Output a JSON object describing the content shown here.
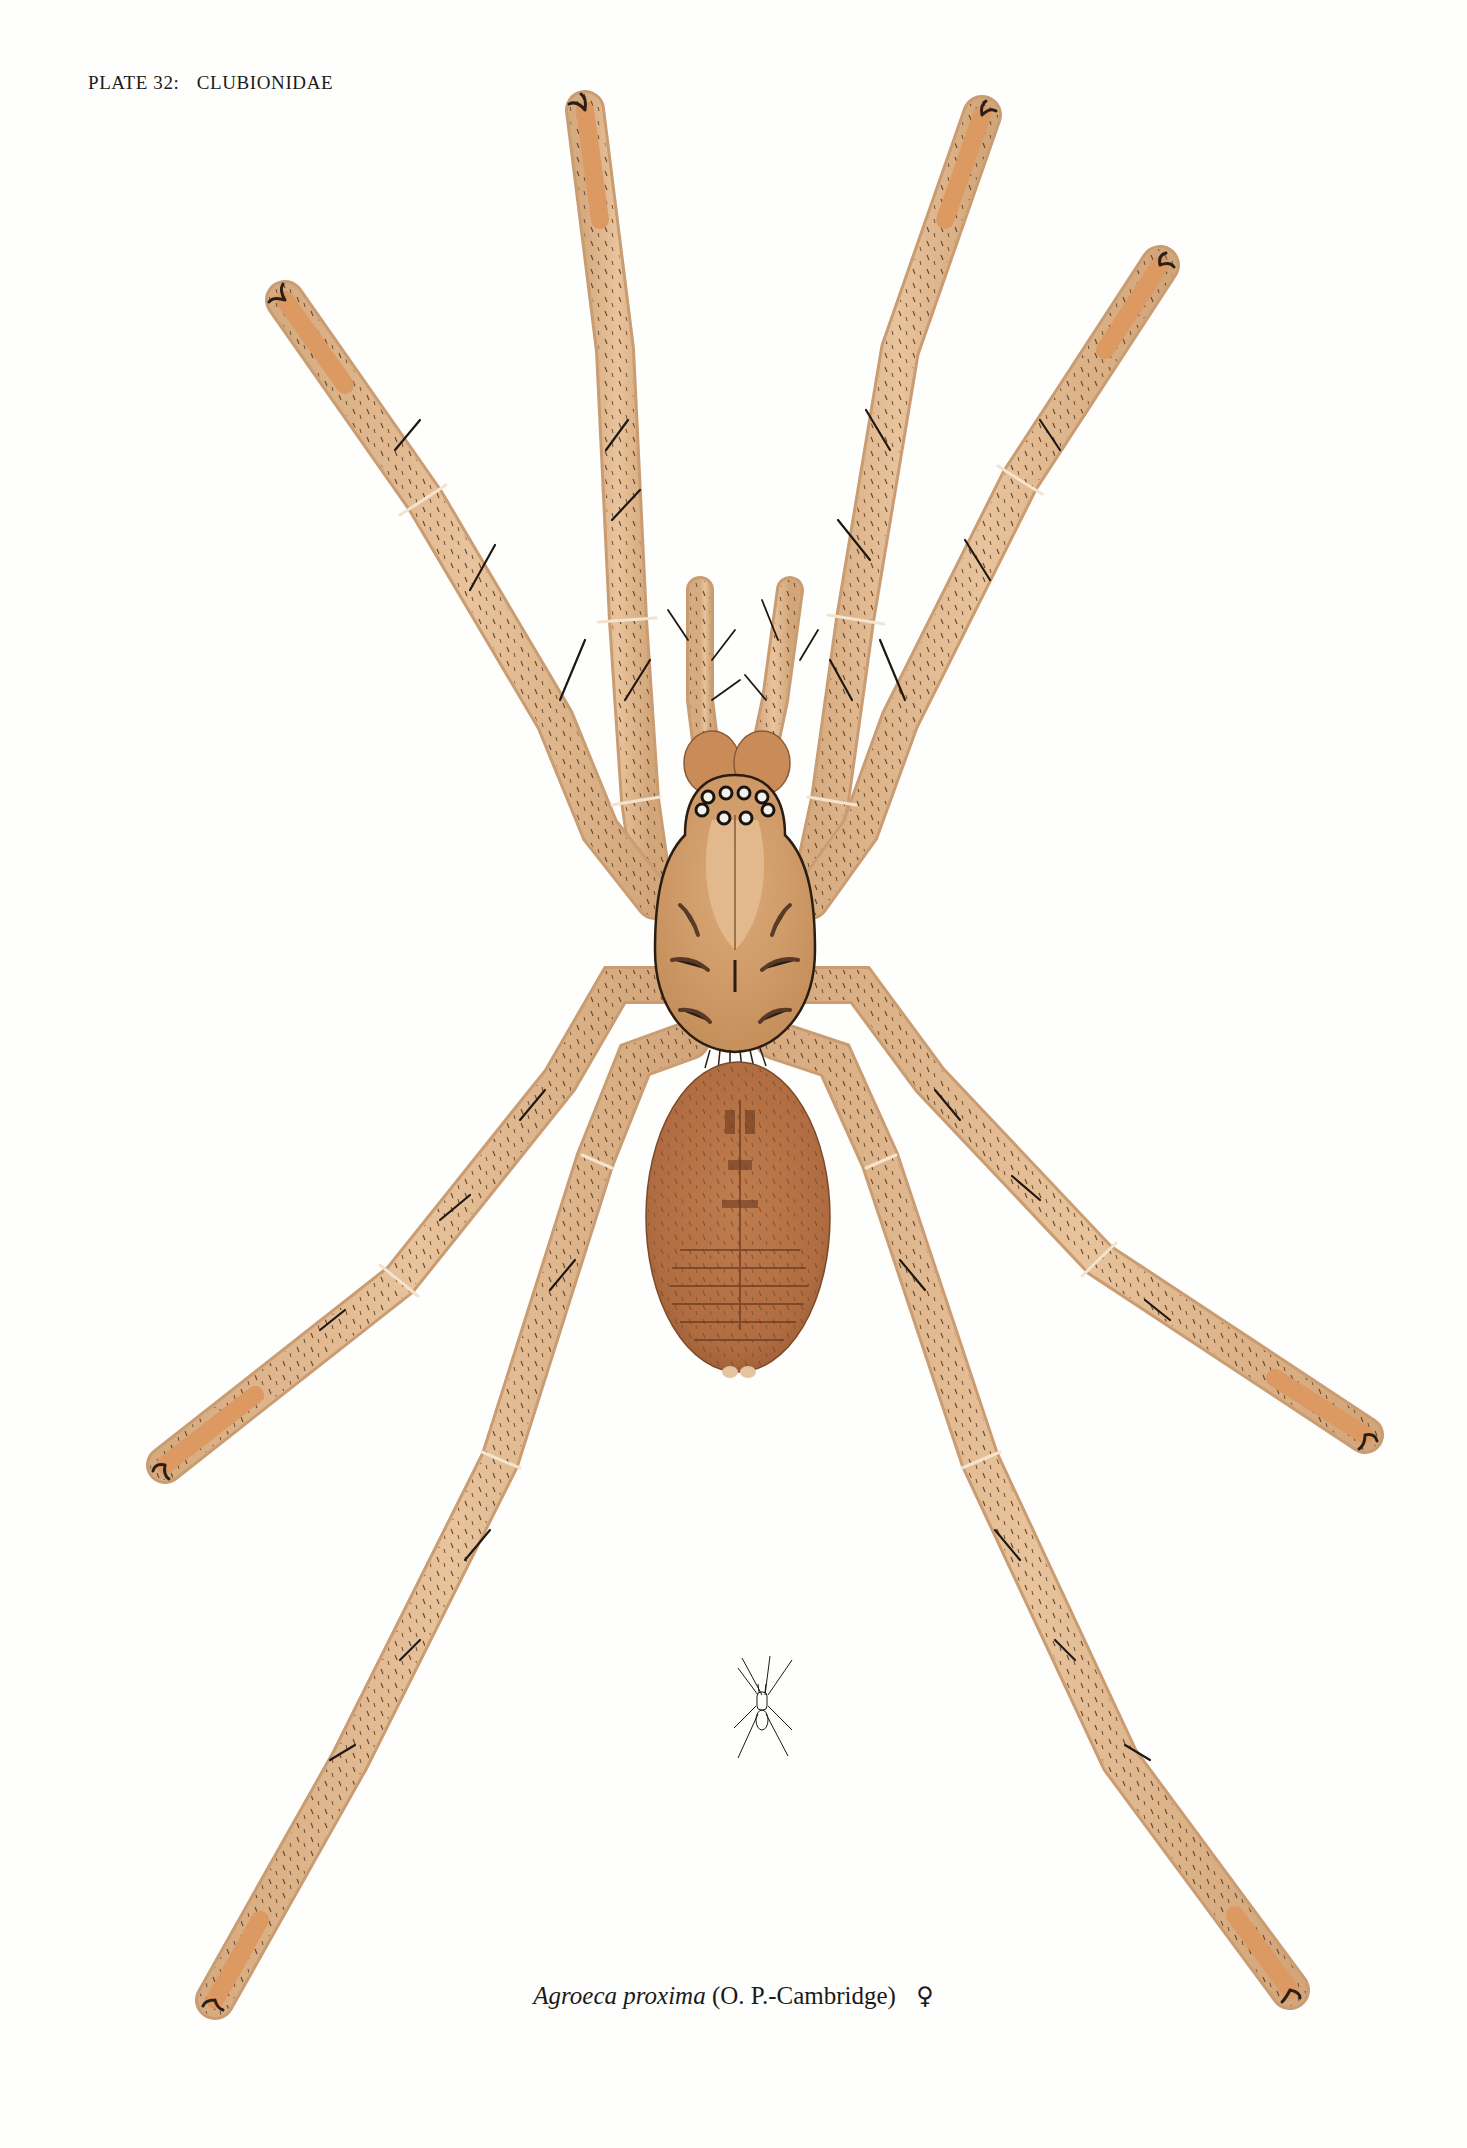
{
  "plate": {
    "label": "PLATE 32:",
    "family": "CLUBIONIDAE"
  },
  "caption": {
    "genus_species": "Agroeca proxima",
    "authority": "(O. P.-Cambridge)",
    "sex_symbol": "♀",
    "sex": "female"
  },
  "figures": {
    "main_illustration": "Agroeca proxima dorsal view, enlarged",
    "scale_figure": "natural size outline"
  },
  "colors": {
    "background": "#fefefc",
    "leg": "#e2b88f",
    "leg_shade": "#c99c72",
    "leg_tip": "#e0935a",
    "carapace": "#cf9a66",
    "carapace_mid": "#e2b88c",
    "abdomen": "#b57346",
    "abdomen_dark": "#8a4f2c",
    "hair": "#2a1f18",
    "outline": "#3a2a1e"
  }
}
